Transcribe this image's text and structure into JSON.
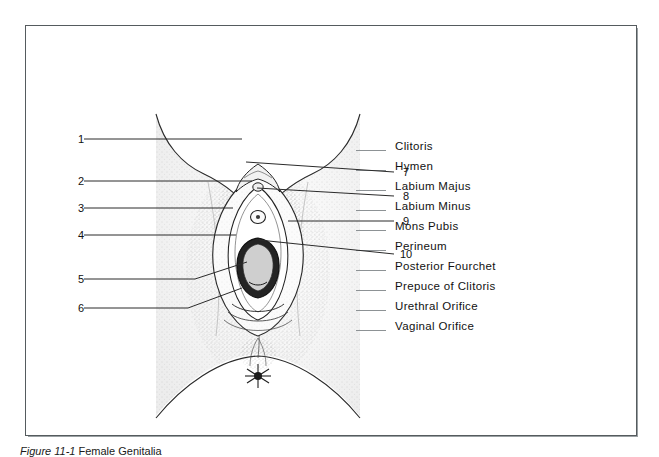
{
  "figure": {
    "caption_prefix": "Figure 11-1",
    "caption_title": "Female Genitalia",
    "border_color": "#555b5e"
  },
  "illustration": {
    "name": "female-external-genitalia-line-drawing",
    "style": "stippled pen-and-ink anatomical drawing",
    "ink_color": "#1d1d1d",
    "stipple_color": "#7a7a7a"
  },
  "callouts": {
    "left": [
      {
        "number": "1",
        "num_x": 70,
        "num_y": 134,
        "line_x1": 84,
        "line_y1": 139,
        "line_x2": 242,
        "line_y2": 139
      },
      {
        "number": "2",
        "num_x": 70,
        "num_y": 176,
        "line_x1": 84,
        "line_y1": 181,
        "line_x2": 252,
        "line_y2": 181
      },
      {
        "number": "3",
        "num_x": 70,
        "num_y": 203,
        "line_x1": 84,
        "line_y1": 208,
        "line_x2": 233,
        "line_y2": 208
      },
      {
        "number": "4",
        "num_x": 70,
        "num_y": 230,
        "line_x1": 84,
        "line_y1": 235,
        "line_x2": 236,
        "line_y2": 235
      },
      {
        "number": "5",
        "num_x": 70,
        "num_y": 274,
        "line_x1": 84,
        "line_y1": 279,
        "line_x2": 195,
        "line_y2": 279,
        "bend_x": 247,
        "bend_y": 262
      },
      {
        "number": "6",
        "num_x": 70,
        "num_y": 303,
        "line_x1": 84,
        "line_y1": 308,
        "line_x2": 188,
        "line_y2": 308,
        "bend_x": 242,
        "bend_y": 288
      }
    ],
    "right": [
      {
        "number": "7",
        "num_x": 403,
        "num_y": 167,
        "line_x1": 246,
        "line_y1": 162,
        "line_x2": 394,
        "line_y2": 172
      },
      {
        "number": "8",
        "num_x": 403,
        "num_y": 191,
        "line_x1": 257,
        "line_y1": 188,
        "line_x2": 394,
        "line_y2": 196
      },
      {
        "number": "9",
        "num_x": 403,
        "num_y": 216,
        "line_x1": 288,
        "line_y1": 221,
        "line_x2": 394,
        "line_y2": 221
      },
      {
        "number": "10",
        "num_x": 400,
        "num_y": 249,
        "line_x1": 259,
        "line_y1": 240,
        "line_x2": 394,
        "line_y2": 254
      }
    ]
  },
  "legend": {
    "items": [
      {
        "label": "Clitoris"
      },
      {
        "label": "Hymen"
      },
      {
        "label": "Labium Majus"
      },
      {
        "label": "Labium Minus"
      },
      {
        "label": "Mons Pubis"
      },
      {
        "label": "Perineum"
      },
      {
        "label": "Posterior Fourchet"
      },
      {
        "label": "Prepuce of Clitoris"
      },
      {
        "label": "Urethral Orifice"
      },
      {
        "label": "Vaginal Orifice"
      }
    ]
  }
}
